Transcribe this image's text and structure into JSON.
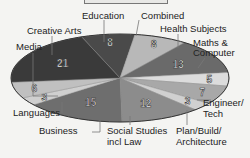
{
  "chart_data": {
    "type": "pie",
    "title": "",
    "style": "3d-ellipse grayscale",
    "categories": [
      "Education",
      "Combined",
      "Health Subjects",
      "Maths & Computer",
      "Engineer/ Tech",
      "Plan/Build/ Architecture",
      "Social Studies incl Law",
      "Business",
      "Languages",
      "Media",
      "Creative Arts"
    ],
    "values": [
      8,
      8,
      13,
      5,
      7,
      3,
      12,
      15,
      3,
      6,
      21
    ],
    "colors": [
      "#4a4a4a",
      "#b8b8b8",
      "#6a6a6a",
      "#dcdcdc",
      "#a8a8a8",
      "#d0d0d0",
      "#8c8c8c",
      "#6e6e6e",
      "#cfcfcf",
      "#c0c0c0",
      "#3a3a3a"
    ]
  },
  "labels": {
    "education": "Education",
    "combined": "Combined",
    "health": "Health Subjects",
    "maths1": "Maths &",
    "maths2": "Computer",
    "engineer1": "Engineer/",
    "engineer2": "Tech",
    "plan1": "Plan/Build/",
    "plan2": "Architecture",
    "social1": "Social Studies",
    "social2": "incl Law",
    "business": "Business",
    "languages": "Languages",
    "media": "Media",
    "creative": "Creative Arts"
  }
}
